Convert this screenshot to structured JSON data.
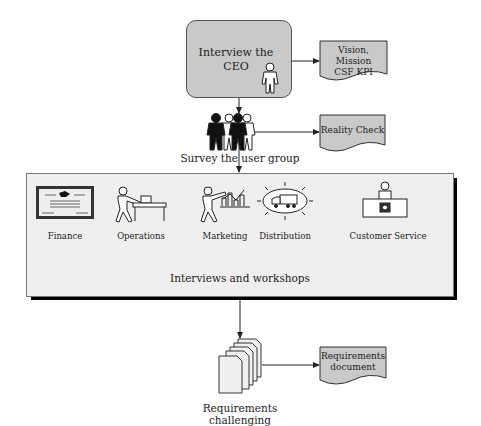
{
  "diagram": {
    "ceo_step": {
      "label": "Interview the CEO",
      "line1": "Interview the",
      "line2": "CEO"
    },
    "vision_doc": {
      "line1": "Vision, Mission",
      "line2": "CSF KPI"
    },
    "survey_step": {
      "label": "Survey the user group"
    },
    "reality_doc": {
      "label": "Reality Check"
    },
    "workshops": {
      "label": "Interviews and workshops",
      "departments": [
        {
          "label": "Finance",
          "icon": "certificate-icon"
        },
        {
          "label": "Operations",
          "icon": "worker-table-icon"
        },
        {
          "label": "Marketing",
          "icon": "presenter-chart-icon"
        },
        {
          "label": "Distribution",
          "icon": "truck-icon"
        },
        {
          "label": "Customer Service",
          "icon": "service-desk-icon"
        }
      ]
    },
    "requirements_step": {
      "label": "Requirements challenging"
    },
    "requirements_doc": {
      "line1": "Requirements",
      "line2": "document"
    },
    "colors": {
      "shape_fill": "#c9c9c9",
      "panel_fill": "#efefef",
      "stroke": "#333333"
    }
  }
}
